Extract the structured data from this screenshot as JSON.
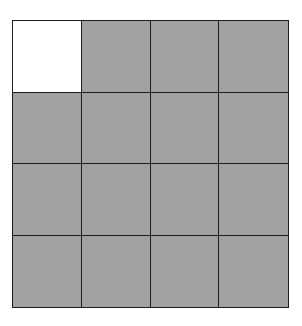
{
  "diagram": {
    "type": "grid",
    "rows": 4,
    "columns": 4,
    "colors": {
      "filled": "#a2a2a2",
      "empty": "#ffffff",
      "line": "#1e1e1e"
    },
    "cells": [
      [
        "empty",
        "filled",
        "filled",
        "filled"
      ],
      [
        "filled",
        "filled",
        "filled",
        "filled"
      ],
      [
        "filled",
        "filled",
        "filled",
        "filled"
      ],
      [
        "filled",
        "filled",
        "filled",
        "filled"
      ]
    ],
    "filled_count": 15,
    "empty_count": 1
  }
}
